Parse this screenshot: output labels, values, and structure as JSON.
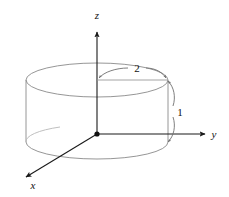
{
  "figure": {
    "background_color": "#ffffff",
    "axis_color": "#1a1a1a",
    "solid_color": "#8a8a8a",
    "label_color": "#111111"
  },
  "axes": {
    "x": {
      "label": "x",
      "direction": "down-left"
    },
    "y": {
      "label": "y",
      "direction": "right"
    },
    "z": {
      "label": "z",
      "direction": "up"
    },
    "origin": {
      "label": "",
      "x": 97,
      "y": 134
    }
  },
  "dimensions": [
    {
      "name": "radius",
      "label": "2",
      "value": 2,
      "measures": "cylinder radius along y from axis to rim"
    },
    {
      "name": "height",
      "label": "1",
      "value": 1,
      "measures": "cylinder height from base to top"
    }
  ],
  "solid": {
    "type": "cylinder",
    "radius": 2,
    "height": 1,
    "top_center": {
      "x": 97,
      "y": 80
    },
    "bottom_center": {
      "x": 97,
      "y": 142
    },
    "rx": 71,
    "ry": 17
  }
}
